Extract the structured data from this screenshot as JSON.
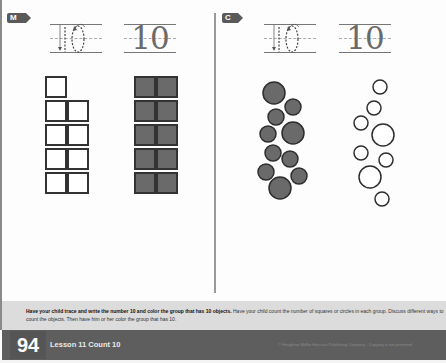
{
  "page": {
    "type": "math worksheet",
    "page_number": "94",
    "lesson_title": "Lesson 11 Count 10",
    "copyright": "© Houghton Mifflin Harcourt Publishing Company · Copying is not permitted"
  },
  "sections": [
    {
      "id": "M",
      "badge_label": "M",
      "trace_number": "10",
      "written_number": "10",
      "groups": [
        {
          "shape": "square",
          "count": 9,
          "colored": false,
          "layout": "column of 1 then 4 rows of 2"
        },
        {
          "shape": "square",
          "count": 10,
          "colored": true,
          "layout": "5 rows of 2"
        }
      ]
    },
    {
      "id": "C",
      "badge_label": "C",
      "trace_number": "10",
      "written_number": "10",
      "groups": [
        {
          "shape": "circle",
          "count": 10,
          "colored": true
        },
        {
          "shape": "circle",
          "count": 8,
          "colored": false
        }
      ]
    }
  ],
  "instructions": {
    "bold": "Have your child trace and write the number 10 and color the group that has 10 objects.",
    "regular": " Have your child count the number of squares or circles in each group. Discuss different ways to count the objects. Then have him or her color the group that has 10."
  },
  "colors": {
    "filled": "#6a6a6a",
    "outline": "#333333",
    "footer_bg": "#5e5e5e",
    "instructions_bg": "#dcdcdc"
  }
}
